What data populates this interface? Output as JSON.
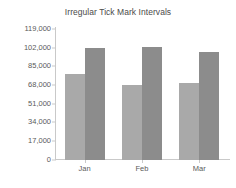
{
  "chart_data": {
    "type": "bar",
    "title": "Irregular Tick Mark Intervals",
    "xlabel": "",
    "ylabel": "",
    "categories": [
      "Jan",
      "Feb",
      "Mar"
    ],
    "series": [
      {
        "name": "Series 1",
        "color": "#a9a9a9",
        "values": [
          78000,
          67500,
          69500
        ]
      },
      {
        "name": "Series 2",
        "color": "#8c8c8c",
        "values": [
          101500,
          103000,
          98000
        ]
      }
    ],
    "ylim": [
      0,
      119000
    ],
    "ytick_values": [
      0,
      17000,
      34000,
      51000,
      68000,
      85000,
      102000,
      119000
    ],
    "ytick_labels": [
      "0",
      "17,000",
      "34,000",
      "51,000",
      "68,000",
      "85,000",
      "102,000",
      "119,000"
    ],
    "grid": false,
    "legend": "none"
  }
}
